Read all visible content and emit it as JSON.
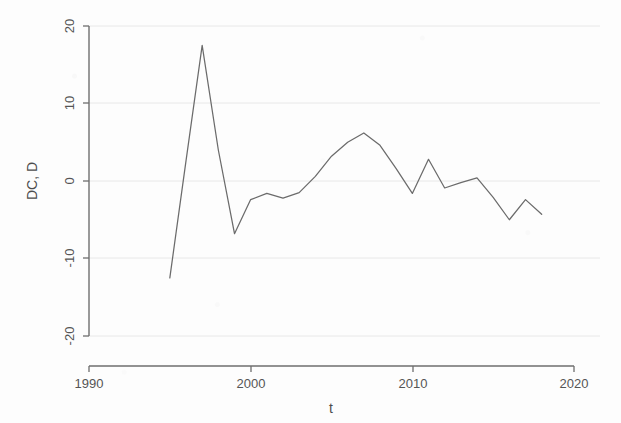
{
  "chart_data": {
    "type": "line",
    "title": "",
    "xlabel": "t",
    "ylabel": "DC, D",
    "xlim": [
      1990,
      2020
    ],
    "ylim": [
      -20,
      20
    ],
    "xticks": [
      1990,
      2000,
      2010,
      2020
    ],
    "xtick_labels": [
      "1990",
      "2000",
      "2010",
      "2020"
    ],
    "yticks": [
      20,
      10,
      0,
      -10,
      -20
    ],
    "ytick_labels": [
      "20",
      "10",
      "0",
      "-10",
      "-20"
    ],
    "grid": true,
    "grid_axis": "y",
    "legend": "none",
    "line_color": "#6b6b6b",
    "x": [
      1995,
      1996,
      1997,
      1998,
      1999,
      2000,
      2001,
      2002,
      2003,
      2004,
      2005,
      2006,
      2007,
      2008,
      2009,
      2010,
      2011,
      2012,
      2013,
      2014,
      2015,
      2016,
      2017,
      2018
    ],
    "values": [
      -12.5,
      2.6,
      17.5,
      4.0,
      -6.8,
      -2.4,
      -1.6,
      -2.2,
      -1.5,
      0.6,
      3.2,
      5.0,
      6.2,
      4.6,
      1.6,
      -1.6,
      2.8,
      -0.9,
      -0.2,
      0.4,
      -2.1,
      -5.0,
      -2.4,
      -4.3
    ],
    "series_name": "DC, D"
  },
  "axis": {
    "y_title": "DC, D",
    "x_title": "t"
  }
}
